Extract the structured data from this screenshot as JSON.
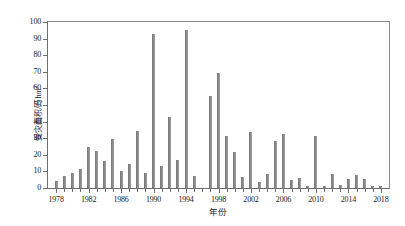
{
  "chart_data": {
    "type": "bar",
    "title": "",
    "xlabel": "年份",
    "ylabel": "受灾面积/万hm²",
    "ylabel_text": "受灾面积/万hm",
    "ylabel_exponent": "2",
    "xlim": [
      1977,
      2019
    ],
    "ylim": [
      0,
      100
    ],
    "ytick_values": [
      0,
      10,
      20,
      30,
      40,
      50,
      60,
      70,
      80,
      90,
      100
    ],
    "ytick_labels": [
      "0",
      "10",
      "20",
      "30",
      "40",
      "50",
      "60",
      "70",
      "80",
      "90",
      "100"
    ],
    "xtick_major_values": [
      1978,
      1982,
      1986,
      1990,
      1994,
      1998,
      2002,
      2006,
      2010,
      2014,
      2018
    ],
    "xtick_major_labels": [
      "1978",
      "1982",
      "1986",
      "1990",
      "1994",
      "1998",
      "2002",
      "2006",
      "2010",
      "2014",
      "2018"
    ],
    "xtick_minor_step": 1,
    "grid": false,
    "legend": null,
    "bar_color": "#8a8a8a",
    "axis_color": "#6e6e6e",
    "categories": [
      1978,
      1979,
      1980,
      1981,
      1982,
      1983,
      1984,
      1985,
      1986,
      1987,
      1988,
      1989,
      1990,
      1991,
      1992,
      1993,
      1994,
      1995,
      1996,
      1997,
      1998,
      1999,
      2000,
      2001,
      2002,
      2003,
      2004,
      2005,
      2006,
      2007,
      2008,
      2009,
      2010,
      2011,
      2012,
      2013,
      2014,
      2015,
      2016,
      2017,
      2018
    ],
    "values": [
      4.0,
      7.5,
      9.0,
      11.5,
      24.5,
      22.5,
      16.5,
      29.5,
      10.5,
      14.5,
      34.5,
      9.0,
      93.0,
      13.5,
      43.0,
      17.0,
      95.0,
      7.5,
      0.0,
      55.5,
      69.5,
      31.5,
      21.5,
      6.5,
      34.0,
      3.5,
      8.5,
      28.5,
      32.5,
      5.0,
      6.0,
      1.5,
      31.5,
      1.0,
      8.5,
      2.0,
      5.5,
      8.0,
      5.5,
      1.5,
      1.5
    ],
    "series": [
      {
        "name": "受灾面积",
        "values": [
          4.0,
          7.5,
          9.0,
          11.5,
          24.5,
          22.5,
          16.5,
          29.5,
          10.5,
          14.5,
          34.5,
          9.0,
          93.0,
          13.5,
          43.0,
          17.0,
          95.0,
          7.5,
          0.0,
          55.5,
          69.5,
          31.5,
          21.5,
          6.5,
          34.0,
          3.5,
          8.5,
          28.5,
          32.5,
          5.0,
          6.0,
          1.5,
          31.5,
          1.0,
          8.5,
          2.0,
          5.5,
          8.0,
          5.5,
          1.5,
          1.5
        ]
      }
    ]
  }
}
